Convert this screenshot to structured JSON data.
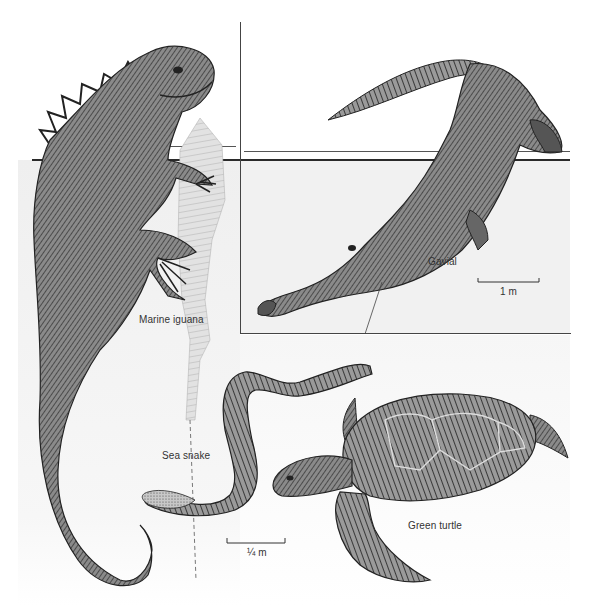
{
  "figure": {
    "animals": [
      {
        "name": "Marine iguana",
        "label": "Marine iguana"
      },
      {
        "name": "Gavial",
        "label": "Gavial"
      },
      {
        "name": "Sea snake",
        "label": "Sea snake"
      },
      {
        "name": "Green turtle",
        "label": "Green turtle"
      }
    ],
    "scale_bars": {
      "gavial_panel": "1 m",
      "main": "¼ m"
    },
    "colors": {
      "ink": "#2a2a2a",
      "water": "#f1f1f1",
      "paper": "#ffffff",
      "label": "#333333"
    }
  }
}
